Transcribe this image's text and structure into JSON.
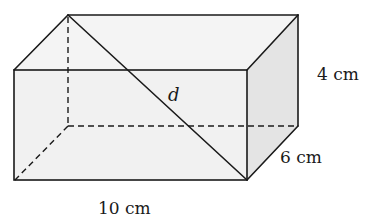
{
  "diagram": {
    "type": "rectangular-prism",
    "labels": {
      "height": "4 cm",
      "depth": "6 cm",
      "length": "10 cm",
      "diagonal": "d"
    },
    "colors": {
      "front_face": "#f1f1f1",
      "top_face": "#f4f4f4",
      "side_face": "#e4e4e4",
      "edge": "#1a1a1a"
    }
  }
}
